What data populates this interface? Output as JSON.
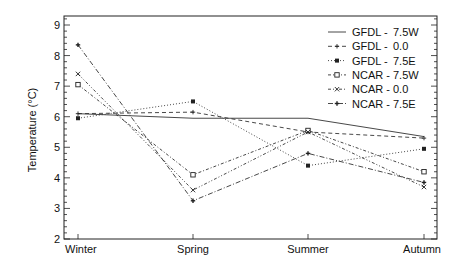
{
  "chart_data": {
    "type": "line",
    "title": "",
    "xlabel": "",
    "ylabel": "Temperature (°C)",
    "categories": [
      "Winter",
      "Spring",
      "Summer",
      "Autumn"
    ],
    "ylim": [
      1.8,
      9.3
    ],
    "yticks": [
      2,
      3,
      4,
      5,
      6,
      7,
      8,
      9
    ],
    "grid": false,
    "legend_position": "upper right",
    "series": [
      {
        "name": "GFDL - 7.5W",
        "model": "GFDL",
        "lon": "7.5W",
        "values": [
          6.1,
          5.95,
          5.95,
          5.35
        ],
        "dash": "",
        "marker": "none"
      },
      {
        "name": "GFDL - 0.0",
        "model": "GFDL",
        "lon": "0.0",
        "values": [
          6.1,
          6.15,
          5.5,
          5.3
        ],
        "dash": "4,3",
        "marker": "plus"
      },
      {
        "name": "GFDL - 7.5E",
        "model": "GFDL",
        "lon": "7.5E",
        "values": [
          5.95,
          6.5,
          4.4,
          4.95
        ],
        "dash": "1,2",
        "marker": "filled-square"
      },
      {
        "name": "NCAR - 7.5W",
        "model": "NCAR",
        "lon": "7.5W",
        "values": [
          7.05,
          4.1,
          5.55,
          4.2
        ],
        "dash": "3,2,1,2",
        "marker": "open-square"
      },
      {
        "name": "NCAR - 0.0",
        "model": "NCAR",
        "lon": "0.0",
        "values": [
          7.4,
          3.6,
          5.5,
          3.7
        ],
        "dash": "3,2,1,2,1,2",
        "marker": "x"
      },
      {
        "name": "NCAR - 7.5E",
        "model": "NCAR",
        "lon": "7.5E",
        "values": [
          8.35,
          3.25,
          4.8,
          3.85
        ],
        "dash": "5,2,1,2",
        "marker": "plus-bold"
      }
    ]
  },
  "legend": [
    {
      "model": "GFDL -",
      "lon": "7.5W"
    },
    {
      "model": "GFDL -",
      "lon": "0.0"
    },
    {
      "model": "GFDL -",
      "lon": "7.5E"
    },
    {
      "model": "NCAR -",
      "lon": "7.5W"
    },
    {
      "model": "NCAR -",
      "lon": "0.0"
    },
    {
      "model": "NCAR -",
      "lon": "7.5E"
    }
  ],
  "colors": {
    "axis": "#222222",
    "lines": "#333333"
  }
}
